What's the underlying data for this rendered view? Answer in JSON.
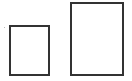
{
  "shapes": [
    {
      "name": "small-rectangle",
      "x": 9,
      "y": 25,
      "w": 41,
      "h": 51
    },
    {
      "name": "large-rectangle",
      "x": 70,
      "y": 2,
      "w": 54,
      "h": 74
    }
  ],
  "colors": {
    "stroke": "#333333",
    "background": "#ffffff"
  }
}
